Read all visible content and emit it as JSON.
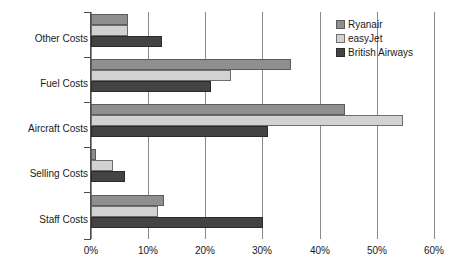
{
  "chart_data": {
    "type": "bar",
    "orientation": "horizontal",
    "title": "",
    "subtitle": "",
    "xlabel": "",
    "ylabel": "",
    "categories": [
      "Other Costs",
      "Fuel Costs",
      "Aircraft Costs",
      "Selling Costs",
      "Staff Costs"
    ],
    "series": [
      {
        "name": "Ryanair",
        "color": "#8f8f8f",
        "values": [
          6.5,
          35.0,
          44.5,
          0.8,
          12.8
        ]
      },
      {
        "name": "easyJet",
        "color": "#d2d2d2",
        "values": [
          6.4,
          24.5,
          54.5,
          3.8,
          11.7
        ]
      },
      {
        "name": "British Airways",
        "color": "#434343",
        "values": [
          12.4,
          21.0,
          31.0,
          6.0,
          30.0
        ]
      }
    ],
    "xlim": [
      0,
      60
    ],
    "xticks": [
      0,
      10,
      20,
      30,
      40,
      50,
      60
    ],
    "xtick_labels": [
      "0%",
      "10%",
      "20%",
      "30%",
      "40%",
      "50%",
      "60%"
    ],
    "grid": "vertical",
    "legend_position": "top-right",
    "value_unit": "%"
  },
  "legend": {
    "items": [
      {
        "label": "Ryanair",
        "swatch": "series-0-swatch"
      },
      {
        "label": "easyJet",
        "swatch": "series-1-swatch"
      },
      {
        "label": "British Airways",
        "swatch": "series-2-swatch"
      }
    ]
  }
}
